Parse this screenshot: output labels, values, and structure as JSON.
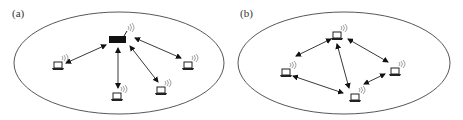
{
  "figure": {
    "panels": [
      {
        "id": "a",
        "label": "(a)",
        "topology": "infrastructure",
        "center_node": {
          "type": "access-point",
          "x": 118,
          "y": 40
        },
        "nodes": [
          {
            "type": "laptop",
            "x": 58,
            "y": 66
          },
          {
            "type": "laptop",
            "x": 118,
            "y": 97
          },
          {
            "type": "laptop",
            "x": 162,
            "y": 91
          },
          {
            "type": "laptop",
            "x": 188,
            "y": 66
          }
        ],
        "links": [
          {
            "from": "ap",
            "to": 0,
            "bidirectional": true
          },
          {
            "from": "ap",
            "to": 1,
            "bidirectional": true
          },
          {
            "from": "ap",
            "to": 2,
            "bidirectional": true
          },
          {
            "from": "ap",
            "to": 3,
            "bidirectional": true
          }
        ]
      },
      {
        "id": "b",
        "label": "(b)",
        "topology": "ad-hoc",
        "nodes": [
          {
            "type": "laptop",
            "x": 337,
            "y": 36
          },
          {
            "type": "laptop",
            "x": 286,
            "y": 73
          },
          {
            "type": "laptop",
            "x": 355,
            "y": 98
          },
          {
            "type": "laptop",
            "x": 395,
            "y": 72
          }
        ],
        "links": [
          {
            "from": 0,
            "to": 1,
            "bidirectional": true
          },
          {
            "from": 0,
            "to": 3,
            "bidirectional": true
          },
          {
            "from": 0,
            "to": 2,
            "bidirectional": true
          },
          {
            "from": 1,
            "to": 2,
            "bidirectional": true
          },
          {
            "from": 2,
            "to": 3,
            "bidirectional": true
          }
        ]
      }
    ]
  }
}
